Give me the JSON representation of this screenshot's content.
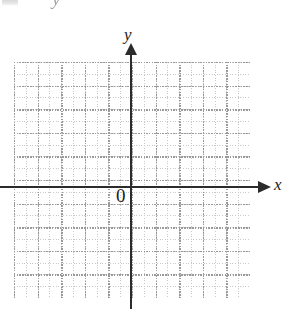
{
  "figure": {
    "kind": "cartesian-coordinate-grid",
    "width": 289,
    "height": 309,
    "background_color": "#ffffff",
    "artifacts": {
      "top_glyph": "y"
    }
  },
  "axes": {
    "x": {
      "label": "x",
      "color": "#2b2b2b",
      "arrow": "right",
      "pixel_y": 187
    },
    "y": {
      "label": "y",
      "color": "#2b2b2b",
      "arrow": "up",
      "pixel_x": 131
    },
    "origin": {
      "label": "0",
      "pixel_x": 131,
      "pixel_y": 187
    }
  },
  "grid": {
    "style": "dotted",
    "minor_color": "#c9c9c9",
    "major_color": "#9a9a9a",
    "minor_spacing_px": 11.8,
    "major_spacing_px": 23.6,
    "major_columns": 10,
    "major_rows": 10,
    "left_px": 14,
    "top_px": 62,
    "width_px": 236,
    "height_px": 236
  },
  "chart_data": {
    "type": "scatter",
    "title": "",
    "subtitle": "",
    "xlabel": "x",
    "ylabel": "y",
    "series": [
      {
        "name": "none",
        "x": [],
        "y": []
      }
    ],
    "annotations": [
      "0"
    ],
    "xlim": [
      -5.5,
      5
    ],
    "ylim": [
      -4.7,
      5.3
    ],
    "xticks": [
      -5,
      -4,
      -3,
      -2,
      -1,
      0,
      1,
      2,
      3,
      4,
      5
    ],
    "yticks": [
      -4,
      -3,
      -2,
      -1,
      0,
      1,
      2,
      3,
      4,
      5
    ],
    "grid": true,
    "grid_style": "dotted",
    "legend": "none",
    "note": "Empty blank coordinate plane — graph paper with labeled x and y axes and origin 0; no data plotted."
  }
}
